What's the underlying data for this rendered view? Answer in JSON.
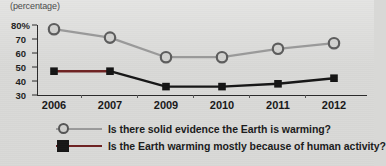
{
  "chart_data": {
    "type": "line",
    "title": "",
    "axis_unit_label": "(percentage)",
    "xlabel": "",
    "ylabel": "",
    "categories": [
      "2006",
      "2007",
      "2009",
      "2010",
      "2011",
      "2012"
    ],
    "ylim": [
      30,
      80
    ],
    "yticks": [
      "30",
      "40",
      "50",
      "60",
      "70",
      "80%"
    ],
    "ytick_values": [
      30,
      40,
      50,
      60,
      70,
      80
    ],
    "grid": false,
    "legend_position": "bottom",
    "series": [
      {
        "name": "Is there solid evidence the Earth is warming?",
        "marker": "open-circle",
        "color": "#9a9a9a",
        "values": [
          77,
          71,
          57,
          57,
          63,
          67
        ]
      },
      {
        "name": "Is the Earth warming mostly because of human activity?",
        "marker": "filled-square",
        "color": "#161616",
        "segment_color_first": "#6e2222",
        "values": [
          47,
          47,
          36,
          36,
          38,
          42
        ]
      }
    ]
  },
  "legend": {
    "items": [
      {
        "label": "Is there solid evidence the Earth is warming?",
        "marker_icon": "open-circle-marker-icon"
      },
      {
        "label": "Is the Earth warming mostly because of human activity?",
        "marker_icon": "filled-square-marker-icon"
      }
    ]
  },
  "colors": {
    "background": "#d9d9d7",
    "axis": "#2b2b2b",
    "series_one": "#9a9a9a",
    "series_two": "#161616",
    "series_two_accent": "#6e2222",
    "text": "#1b1b1b"
  }
}
